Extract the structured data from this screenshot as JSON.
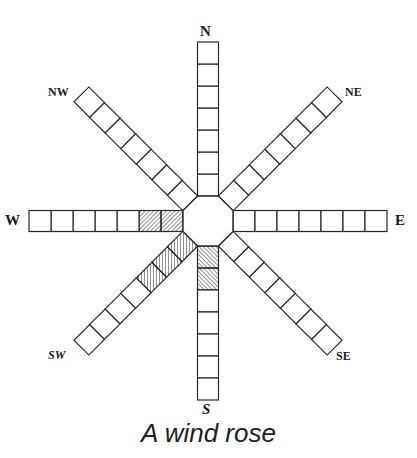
{
  "caption": "A wind rose",
  "labels": {
    "N": "N",
    "NE": "NE",
    "E": "E",
    "SE": "SE",
    "S": "S",
    "SW": "SW",
    "W": "W",
    "NW": "NW"
  },
  "center": {
    "x": 208,
    "y": 221
  },
  "geometry": {
    "apothem": 25,
    "arm_width": 21,
    "cell_length": 22
  },
  "colors": {
    "stroke": "#2a2a2a",
    "hatch": "#2a2a2a",
    "fill": "#ffffff"
  },
  "arms": [
    {
      "direction": "N",
      "angle": -90,
      "cells": 7,
      "hatched": 0
    },
    {
      "direction": "NE",
      "angle": -45,
      "cells": 7,
      "hatched": 0
    },
    {
      "direction": "E",
      "angle": 0,
      "cells": 7,
      "hatched": 0
    },
    {
      "direction": "SE",
      "angle": 45,
      "cells": 7,
      "hatched": 0
    },
    {
      "direction": "S",
      "angle": 90,
      "cells": 7,
      "hatched": 2
    },
    {
      "direction": "SW",
      "angle": 135,
      "cells": 7,
      "hatched": 3
    },
    {
      "direction": "W",
      "angle": 180,
      "cells": 7,
      "hatched": 2
    },
    {
      "direction": "NW",
      "angle": -135,
      "cells": 7,
      "hatched": 0
    }
  ]
}
